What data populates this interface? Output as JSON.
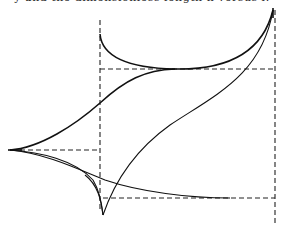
{
  "figure": {
    "caption_fragment": "y  and  the  dimensionless  length  h  versus  l.",
    "colors": {
      "background": "#ffffff",
      "ink": "#111111"
    },
    "guides": [
      {
        "id": "left-vertical",
        "x1": 100,
        "y1": 20,
        "x2": 100,
        "y2": 210
      },
      {
        "id": "right-vertical",
        "x1": 275,
        "y1": 10,
        "x2": 275,
        "y2": 226
      },
      {
        "id": "upper-horizontal",
        "x1": 100,
        "y1": 69,
        "x2": 275,
        "y2": 69
      },
      {
        "id": "left-horizontal",
        "x1": 12,
        "y1": 150,
        "x2": 100,
        "y2": 150
      },
      {
        "id": "lower-horizontal",
        "x1": 103,
        "y1": 198,
        "x2": 275,
        "y2": 198
      }
    ],
    "cusps": [
      {
        "id": "left-cusp",
        "x": 10,
        "y": 150
      },
      {
        "id": "bottom-cusp",
        "x": 103,
        "y": 215
      },
      {
        "id": "top-right-cusp",
        "x": 273,
        "y": 10
      }
    ]
  }
}
